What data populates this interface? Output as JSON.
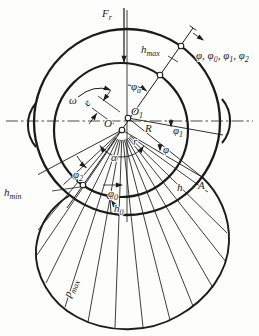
{
  "figure": {
    "name": "journal-bearing-hydrodynamic-pressure-diagram",
    "background": "#fdfdfc",
    "ink": "#1c1c1c",
    "labels": [
      {
        "id": "force-label",
        "x": 102,
        "y": 17,
        "parts": [
          {
            "t": "F"
          },
          {
            "t": "r",
            "sub": true
          }
        ]
      },
      {
        "id": "h-max-label",
        "x": 141,
        "y": 53,
        "parts": [
          {
            "t": "h"
          },
          {
            "t": "max",
            "sub": true
          }
        ]
      },
      {
        "id": "phi-sequence-label",
        "x": 196,
        "y": 59,
        "parts": [
          {
            "t": "φ, φ"
          },
          {
            "t": "0",
            "sub": true
          },
          {
            "t": ", φ"
          },
          {
            "t": "1",
            "sub": true
          },
          {
            "t": ", φ"
          },
          {
            "t": "2",
            "sub": true
          }
        ]
      },
      {
        "id": "phi-a-label",
        "x": 131,
        "y": 90,
        "parts": [
          {
            "t": "φ"
          },
          {
            "t": "a",
            "sub": true
          }
        ]
      },
      {
        "id": "omega-label",
        "x": 69,
        "y": 104,
        "parts": [
          {
            "t": "ω"
          }
        ]
      },
      {
        "id": "eccentricity-label",
        "x": 0,
        "y": 0,
        "transform": "translate(88,107) rotate(-50)",
        "parts": [
          {
            "t": "e"
          }
        ]
      },
      {
        "id": "bearing-center-label",
        "x": 104,
        "y": 127,
        "parts": [
          {
            "t": "O"
          }
        ]
      },
      {
        "id": "journal-center-label",
        "x": 131,
        "y": 115,
        "parts": [
          {
            "t": "O"
          },
          {
            "t": "1",
            "sub": true
          }
        ]
      },
      {
        "id": "phi-1-label",
        "x": 173,
        "y": 134,
        "parts": [
          {
            "t": "φ"
          },
          {
            "t": "1",
            "sub": true
          }
        ]
      },
      {
        "id": "radius-R-label",
        "x": 145,
        "y": 132,
        "parts": [
          {
            "t": "R"
          }
        ]
      },
      {
        "id": "radius-r-label",
        "x": 133,
        "y": 145,
        "parts": [
          {
            "t": "r"
          }
        ]
      },
      {
        "id": "phi-label",
        "x": 163,
        "y": 153,
        "parts": [
          {
            "t": "φ"
          }
        ]
      },
      {
        "id": "film-h-label",
        "x": 177,
        "y": 191,
        "parts": [
          {
            "t": "h"
          }
        ]
      },
      {
        "id": "point-A-label",
        "x": 198,
        "y": 189,
        "parts": [
          {
            "t": "A"
          }
        ]
      },
      {
        "id": "alpha-label",
        "x": 111,
        "y": 161,
        "parts": [
          {
            "t": "α"
          }
        ]
      },
      {
        "id": "phi-2-label",
        "x": 73,
        "y": 178,
        "parts": [
          {
            "t": "φ"
          },
          {
            "t": "2",
            "sub": true
          }
        ]
      },
      {
        "id": "h-min-label",
        "x": 4,
        "y": 196,
        "parts": [
          {
            "t": "h"
          },
          {
            "t": "min",
            "sub": true
          }
        ]
      },
      {
        "id": "phi-0-label",
        "x": 108,
        "y": 197,
        "parts": [
          {
            "t": "φ"
          },
          {
            "t": "0",
            "sub": true
          }
        ]
      },
      {
        "id": "h-0-label",
        "x": 114,
        "y": 212,
        "parts": [
          {
            "t": "h"
          },
          {
            "t": "0",
            "sub": true
          }
        ]
      },
      {
        "id": "p-max-label",
        "x": 0,
        "y": 0,
        "transform": "translate(70,298) rotate(-68)",
        "parts": [
          {
            "t": "p"
          },
          {
            "t": "max",
            "sub": true
          }
        ]
      }
    ]
  }
}
